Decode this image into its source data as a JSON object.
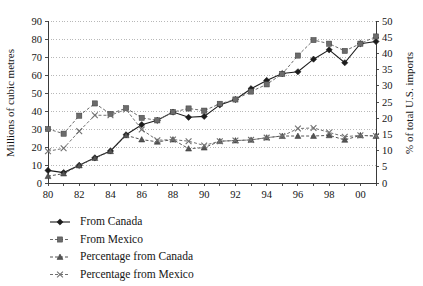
{
  "chart_data": {
    "type": "line",
    "title": "",
    "xlabel": "",
    "ylabel": "Millions of cubic metres",
    "y2label": "% of total U.S. imports",
    "grid": true,
    "legend_position": "bottom-left",
    "x": [
      1980,
      1981,
      1982,
      1983,
      1984,
      1985,
      1986,
      1987,
      1988,
      1989,
      1990,
      1991,
      1992,
      1993,
      1994,
      1995,
      1996,
      1997,
      1998,
      1999,
      2000,
      2001
    ],
    "x_tick_labels": [
      "80",
      "",
      "82",
      "",
      "84",
      "",
      "86",
      "",
      "88",
      "",
      "90",
      "",
      "92",
      "",
      "94",
      "",
      "96",
      "",
      "98",
      "",
      "00",
      ""
    ],
    "x_tick_labels_shown": [
      "80",
      "82",
      "84",
      "86",
      "88",
      "90",
      "92",
      "94",
      "96",
      "98",
      "00"
    ],
    "ylim": [
      0,
      90
    ],
    "y_ticks": [
      0,
      10,
      20,
      30,
      40,
      50,
      60,
      70,
      80,
      90
    ],
    "y2lim": [
      0,
      50
    ],
    "y2_ticks": [
      0,
      5,
      10,
      15,
      20,
      25,
      30,
      35,
      40,
      45,
      50
    ],
    "series": [
      {
        "name": "From Canada",
        "axis": "left",
        "marker": "diamond",
        "color": "#1c1c1c",
        "line_style": "solid",
        "values": [
          7.0,
          5.8,
          9.8,
          14.0,
          17.8,
          26.8,
          32.4,
          34.8,
          39.4,
          36.5,
          37.0,
          43.4,
          46.4,
          52.4,
          57.0,
          60.8,
          61.8,
          68.8,
          74.0,
          66.8,
          77.4,
          78.6
        ]
      },
      {
        "name": "From Mexico",
        "axis": "left",
        "marker": "square",
        "color": "#6b6b6b",
        "line_style": "dashed",
        "values": [
          30.0,
          27.4,
          37.4,
          44.2,
          38.4,
          41.6,
          36.2,
          34.8,
          39.4,
          41.4,
          40.2,
          44.0,
          46.4,
          50.8,
          54.8,
          60.6,
          70.8,
          79.4,
          77.4,
          73.4,
          77.4,
          81.4
        ]
      },
      {
        "name": "Percentage from Canada",
        "axis": "right",
        "marker": "triangle",
        "color": "#555555",
        "line_style": "dashed",
        "values": [
          2.1,
          2.9,
          5.4,
          7.7,
          9.8,
          14.7,
          13.4,
          12.7,
          13.4,
          10.6,
          10.9,
          12.9,
          13.1,
          13.3,
          14.0,
          14.5,
          14.5,
          14.5,
          14.7,
          13.3,
          14.7,
          14.5
        ]
      },
      {
        "name": "Percentage from Mexico",
        "axis": "right",
        "marker": "cross",
        "color": "#707070",
        "line_style": "dashed",
        "values": [
          9.8,
          10.7,
          16.0,
          20.9,
          20.9,
          22.7,
          16.5,
          13.2,
          13.4,
          12.9,
          11.6,
          12.9,
          13.1,
          13.3,
          14.0,
          14.5,
          16.8,
          17.0,
          15.6,
          14.3,
          14.7,
          14.5
        ]
      }
    ]
  },
  "axes": {
    "left_title": "Millions of cubic metres",
    "right_title": "% of total U.S. imports"
  },
  "legend": {
    "items": [
      {
        "label": "From Canada",
        "marker": "diamond",
        "color": "#1c1c1c",
        "line_style": "solid"
      },
      {
        "label": "From Mexico",
        "marker": "square",
        "color": "#6b6b6b",
        "line_style": "dashed"
      },
      {
        "label": "Percentage from Canada",
        "marker": "triangle",
        "color": "#555555",
        "line_style": "dashed"
      },
      {
        "label": "Percentage from Mexico",
        "marker": "cross",
        "color": "#707070",
        "line_style": "dashed"
      }
    ]
  }
}
